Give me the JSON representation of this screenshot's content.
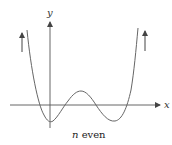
{
  "figure": {
    "caption_var": "n",
    "caption_rest": " even",
    "x_axis_label": "x",
    "y_axis_label": "y",
    "colors": {
      "curve": "#666666",
      "axes": "#555555",
      "arrows": "#444444",
      "background": "#ffffff"
    },
    "curve_description": "Even-degree polynomial with four real roots; both ends rise to +infinity",
    "end_behavior_arrows": [
      "up-left",
      "up-right"
    ]
  }
}
